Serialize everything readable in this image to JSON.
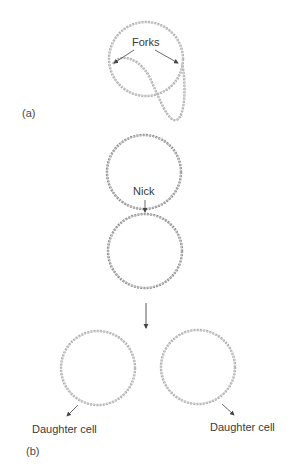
{
  "figure": {
    "panel_a": {
      "label": "(a)",
      "annotation": "Forks",
      "description": "Theta replication intermediate: circular DNA with a replication loop between two forks"
    },
    "panel_b": {
      "label": "(b)",
      "nick_label": "Nick",
      "left_daughter_label": "Daughter cell",
      "right_daughter_label": "Daughter cell",
      "description": "Two interlocked circles separated at a nick, producing two daughter circles"
    },
    "colors": {
      "strand": "#9a9a9a",
      "strand_dark": "#6a6a6a",
      "arrow": "#444444",
      "text": "#3a3a3a"
    }
  }
}
